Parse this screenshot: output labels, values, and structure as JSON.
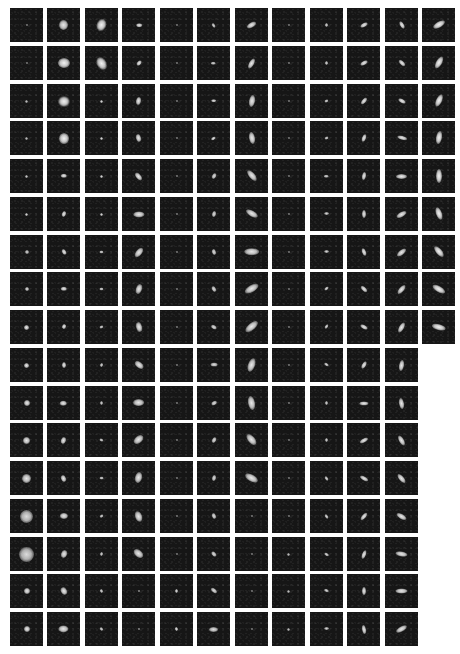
{
  "figure": {
    "layout": {
      "col_x": [
        10,
        47,
        85,
        122,
        160,
        197,
        235,
        272,
        310,
        347,
        385,
        422
      ],
      "row_y": [
        8,
        46,
        84,
        121,
        159,
        197,
        235,
        272,
        310,
        348,
        386,
        423,
        461,
        499,
        537,
        574,
        612
      ],
      "tile_w": 33,
      "tile_h": 34
    },
    "colors": {
      "background": "#ffffff",
      "tile": "#161616",
      "blob": "#f2f2f2"
    },
    "legend_for_tiles": "each tile = [size_px, axis_ratio, angle_deg, brightness]",
    "rows": [
      [
        [
          2,
          1,
          0,
          0.6
        ],
        [
          9,
          1.1,
          0,
          0.9
        ],
        [
          9,
          1.3,
          20,
          0.95
        ],
        [
          4,
          1.6,
          90,
          0.9
        ],
        [
          2,
          1,
          0,
          0.6
        ],
        [
          3,
          1.5,
          -30,
          0.8
        ],
        [
          5,
          2,
          60,
          0.9
        ],
        [
          2,
          1,
          0,
          0.6
        ],
        [
          3,
          1.2,
          0,
          0.8
        ],
        [
          4,
          2,
          60,
          0.9
        ],
        [
          4,
          2,
          -30,
          0.9
        ],
        [
          6,
          2.2,
          60,
          0.95
        ]
      ],
      [
        [
          2,
          1,
          0,
          0.6
        ],
        [
          10,
          1.2,
          90,
          0.95
        ],
        [
          9,
          1.4,
          -30,
          0.95
        ],
        [
          4,
          1.6,
          40,
          0.9
        ],
        [
          2,
          1,
          0,
          0.6
        ],
        [
          3,
          1.5,
          90,
          0.8
        ],
        [
          5,
          2.2,
          30,
          0.9
        ],
        [
          2,
          1,
          0,
          0.6
        ],
        [
          3,
          1.2,
          0,
          0.8
        ],
        [
          4,
          2,
          60,
          0.9
        ],
        [
          4,
          2,
          -45,
          0.9
        ],
        [
          6,
          2.2,
          30,
          0.95
        ]
      ],
      [
        [
          3,
          1,
          0,
          0.7
        ],
        [
          10,
          1.1,
          90,
          0.95
        ],
        [
          3,
          1,
          0,
          0.8
        ],
        [
          5,
          1.6,
          10,
          0.9
        ],
        [
          2,
          1,
          0,
          0.6
        ],
        [
          3,
          1.8,
          90,
          0.85
        ],
        [
          6,
          2,
          10,
          0.9
        ],
        [
          2,
          1,
          0,
          0.6
        ],
        [
          3,
          1.3,
          60,
          0.8
        ],
        [
          4,
          2,
          40,
          0.9
        ],
        [
          4,
          2,
          -60,
          0.9
        ],
        [
          6,
          2.2,
          25,
          0.95
        ]
      ],
      [
        [
          3,
          1,
          0,
          0.7
        ],
        [
          10,
          1.1,
          0,
          0.95
        ],
        [
          3,
          1,
          0,
          0.8
        ],
        [
          5,
          1.6,
          -15,
          0.9
        ],
        [
          2,
          1,
          0,
          0.6
        ],
        [
          3,
          1.6,
          60,
          0.85
        ],
        [
          6,
          2,
          -10,
          0.9
        ],
        [
          2,
          1,
          0,
          0.6
        ],
        [
          3,
          1.4,
          60,
          0.8
        ],
        [
          4,
          2,
          20,
          0.9
        ],
        [
          4,
          2.4,
          -75,
          0.9
        ],
        [
          6,
          2.2,
          10,
          0.95
        ]
      ],
      [
        [
          3,
          1,
          0,
          0.75
        ],
        [
          4,
          1.4,
          90,
          0.9
        ],
        [
          3,
          1,
          0,
          0.8
        ],
        [
          5,
          1.8,
          -40,
          0.9
        ],
        [
          2,
          1,
          0,
          0.6
        ],
        [
          4,
          1.6,
          30,
          0.85
        ],
        [
          6,
          2.2,
          -40,
          0.9
        ],
        [
          2,
          1,
          0,
          0.6
        ],
        [
          3,
          1.5,
          90,
          0.8
        ],
        [
          4,
          2,
          10,
          0.9
        ],
        [
          5,
          2.2,
          90,
          0.9
        ],
        [
          6,
          2.2,
          0,
          0.95
        ]
      ],
      [
        [
          3,
          1,
          0,
          0.8
        ],
        [
          4,
          1.4,
          20,
          0.9
        ],
        [
          3,
          1,
          0,
          0.8
        ],
        [
          6,
          1.8,
          90,
          0.9
        ],
        [
          2,
          1,
          0,
          0.6
        ],
        [
          4,
          1.6,
          10,
          0.85
        ],
        [
          6,
          2.2,
          -60,
          0.9
        ],
        [
          2,
          1,
          0,
          0.6
        ],
        [
          3,
          1.7,
          90,
          0.8
        ],
        [
          4,
          2,
          0,
          0.9
        ],
        [
          5,
          2.2,
          60,
          0.9
        ],
        [
          6,
          2.2,
          -20,
          0.95
        ]
      ],
      [
        [
          4,
          1,
          0,
          0.8
        ],
        [
          4,
          1.4,
          -30,
          0.9
        ],
        [
          3,
          1.3,
          90,
          0.8
        ],
        [
          6,
          1.8,
          40,
          0.9
        ],
        [
          2,
          1,
          0,
          0.6
        ],
        [
          4,
          1.6,
          -15,
          0.85
        ],
        [
          7,
          2.2,
          90,
          0.9
        ],
        [
          2,
          1,
          0,
          0.6
        ],
        [
          3,
          1.7,
          90,
          0.8
        ],
        [
          4,
          2,
          -20,
          0.9
        ],
        [
          5,
          2.2,
          50,
          0.9
        ],
        [
          6,
          2.2,
          -40,
          0.95
        ]
      ],
      [
        [
          4,
          1,
          0,
          0.85
        ],
        [
          4,
          1.4,
          90,
          0.9
        ],
        [
          3,
          1.3,
          90,
          0.8
        ],
        [
          6,
          1.6,
          20,
          0.9
        ],
        [
          2,
          1,
          0,
          0.6
        ],
        [
          4,
          1.6,
          -30,
          0.85
        ],
        [
          7,
          2.2,
          60,
          0.9
        ],
        [
          2,
          1,
          0,
          0.6
        ],
        [
          3,
          1.7,
          50,
          0.8
        ],
        [
          4,
          2,
          -45,
          0.9
        ],
        [
          5,
          2.2,
          40,
          0.9
        ],
        [
          6,
          2.4,
          -60,
          0.95
        ]
      ],
      [
        [
          5,
          1,
          0,
          0.9
        ],
        [
          4,
          1.3,
          20,
          0.9
        ],
        [
          3,
          1.3,
          60,
          0.8
        ],
        [
          6,
          1.6,
          -15,
          0.9
        ],
        [
          2,
          1,
          0,
          0.6
        ],
        [
          4,
          1.6,
          -60,
          0.85
        ],
        [
          7,
          2.2,
          50,
          0.9
        ],
        [
          2,
          1,
          0,
          0.6
        ],
        [
          3,
          1.7,
          30,
          0.8
        ],
        [
          4,
          2,
          -60,
          0.9
        ],
        [
          5,
          2.2,
          30,
          0.9
        ],
        [
          6,
          2.4,
          -75,
          0.95
        ]
      ],
      [
        [
          5,
          1,
          0,
          0.9
        ],
        [
          4,
          1.3,
          0,
          0.9
        ],
        [
          3,
          1.4,
          15,
          0.8
        ],
        [
          6,
          1.6,
          -50,
          0.9
        ],
        [
          2,
          1,
          0,
          0.6
        ],
        [
          4,
          1.8,
          90,
          0.85
        ],
        [
          7,
          2,
          20,
          0.9
        ],
        [
          2,
          1,
          0,
          0.6
        ],
        [
          3,
          1.7,
          -60,
          0.8
        ],
        [
          4,
          2,
          30,
          0.9
        ],
        [
          5,
          2.2,
          10,
          0.9
        ]
      ],
      [
        [
          6,
          1,
          0,
          0.9
        ],
        [
          5,
          1.3,
          90,
          0.9
        ],
        [
          3,
          1.3,
          0,
          0.8
        ],
        [
          7,
          1.6,
          90,
          0.9
        ],
        [
          2,
          1,
          0,
          0.6
        ],
        [
          4,
          1.6,
          60,
          0.85
        ],
        [
          7,
          2,
          -10,
          0.9
        ],
        [
          2,
          1,
          0,
          0.6
        ],
        [
          3,
          1.5,
          0,
          0.8
        ],
        [
          4,
          2.2,
          90,
          0.9
        ],
        [
          5,
          2.2,
          -10,
          0.9
        ]
      ],
      [
        [
          7,
          1,
          0,
          0.9
        ],
        [
          5,
          1.3,
          20,
          0.9
        ],
        [
          3,
          1.4,
          -60,
          0.8
        ],
        [
          7,
          1.6,
          50,
          0.9
        ],
        [
          2,
          1,
          0,
          0.6
        ],
        [
          4,
          1.6,
          30,
          0.85
        ],
        [
          7,
          1.9,
          -40,
          0.9
        ],
        [
          2,
          1,
          0,
          0.6
        ],
        [
          3,
          1.4,
          0,
          0.8
        ],
        [
          4,
          2.2,
          60,
          0.9
        ],
        [
          5,
          2.2,
          -30,
          0.9
        ]
      ],
      [
        [
          9,
          1,
          0,
          0.9
        ],
        [
          5,
          1.4,
          -20,
          0.9
        ],
        [
          3,
          1.4,
          90,
          0.8
        ],
        [
          7,
          1.6,
          15,
          0.9
        ],
        [
          2,
          1,
          0,
          0.6
        ],
        [
          4,
          1.6,
          10,
          0.85
        ],
        [
          7,
          2,
          -60,
          0.9
        ],
        [
          2,
          1,
          0,
          0.6
        ],
        [
          3,
          1.6,
          -30,
          0.8
        ],
        [
          4,
          2.2,
          -60,
          0.9
        ],
        [
          5,
          2.2,
          -40,
          0.9
        ]
      ],
      [
        [
          13,
          1,
          0,
          0.85
        ],
        [
          6,
          1.3,
          90,
          0.9
        ],
        [
          3,
          1.4,
          50,
          0.8
        ],
        [
          7,
          1.5,
          -20,
          0.9
        ],
        [
          2,
          1,
          0,
          0.6
        ],
        [
          4,
          1.6,
          -20,
          0.85
        ],
        [
          2,
          1,
          0,
          0.6
        ],
        [
          2,
          1,
          0,
          0.6
        ],
        [
          3,
          1.6,
          -30,
          0.8
        ],
        [
          4,
          2.2,
          40,
          0.9
        ],
        [
          5,
          2.2,
          -60,
          0.9
        ]
      ],
      [
        [
          15,
          1,
          0,
          0.85
        ],
        [
          6,
          1.4,
          20,
          0.9
        ],
        [
          3,
          1.4,
          10,
          0.8
        ],
        [
          7,
          1.6,
          -50,
          0.9
        ],
        [
          2,
          1,
          0,
          0.6
        ],
        [
          4,
          1.6,
          -40,
          0.85
        ],
        [
          2,
          1,
          0,
          0.6
        ],
        [
          3,
          1,
          0,
          0.7
        ],
        [
          3,
          1.6,
          -60,
          0.8
        ],
        [
          4,
          2.2,
          20,
          0.9
        ],
        [
          5,
          2.4,
          -80,
          0.9
        ]
      ],
      [
        [
          6,
          1,
          0,
          0.9
        ],
        [
          6,
          1.4,
          -30,
          0.9
        ],
        [
          3,
          1.4,
          -20,
          0.8
        ],
        [
          2,
          1,
          0,
          0.7
        ],
        [
          3,
          1.4,
          0,
          0.85
        ],
        [
          4,
          1.8,
          -50,
          0.85
        ],
        [
          2,
          1,
          0,
          0.6
        ],
        [
          3,
          1,
          0,
          0.7
        ],
        [
          3,
          1.7,
          -70,
          0.8
        ],
        [
          4,
          2.2,
          0,
          0.9
        ],
        [
          5,
          2.4,
          90,
          0.9
        ]
      ],
      [
        [
          6,
          1,
          0,
          0.9
        ],
        [
          7,
          1.4,
          90,
          0.9
        ],
        [
          3,
          1.4,
          -40,
          0.8
        ],
        [
          2,
          1,
          0,
          0.7
        ],
        [
          3,
          1.4,
          -15,
          0.85
        ],
        [
          5,
          1.8,
          90,
          0.85
        ],
        [
          2,
          1,
          0,
          0.6
        ],
        [
          3,
          1,
          0,
          0.7
        ],
        [
          3,
          1.7,
          90,
          0.8
        ],
        [
          4,
          2.2,
          -10,
          0.9
        ],
        [
          5,
          2.4,
          60,
          0.9
        ]
      ]
    ]
  }
}
